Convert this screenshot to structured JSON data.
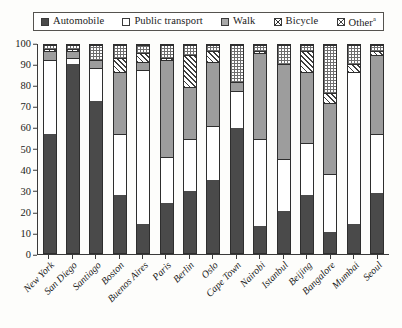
{
  "legend": {
    "items": [
      {
        "label": "Automobile",
        "icon": "solid-dark-square-swatch",
        "key": "auto",
        "color": "#4a4a4a"
      },
      {
        "label": "Public transport",
        "icon": "empty-square-swatch",
        "key": "pt",
        "color": "#ffffff"
      },
      {
        "label": "Walk",
        "icon": "gray-square-swatch",
        "key": "walk",
        "color": "#9d9d9d"
      },
      {
        "label": "Bicycle",
        "icon": "crosshatch-square-swatch",
        "key": "bike",
        "color": "#3d3d3d"
      },
      {
        "label": "Other",
        "icon": "dotted-square-swatch",
        "key": "other",
        "color": "#6e6e6e",
        "superscript": "a"
      }
    ]
  },
  "y_axis": {
    "ticks": [
      "0",
      "10",
      "20",
      "30",
      "40",
      "50",
      "60",
      "70",
      "80",
      "90",
      "100"
    ]
  },
  "chart_data": {
    "type": "bar",
    "stacked": true,
    "title": "",
    "xlabel": "",
    "ylabel": "",
    "ylim": [
      0,
      100
    ],
    "grid": false,
    "legend_position": "top",
    "categories": [
      "New York",
      "San Diego",
      "Santiago",
      "Boston",
      "Buenos Aires",
      "Paris",
      "Berlin",
      "Oslo",
      "Cape Town",
      "Nairobi",
      "Istanbul",
      "Beijing",
      "Bangalore",
      "Mumbai",
      "Seoul"
    ],
    "series": [
      {
        "name": "Automobile",
        "values": [
          57,
          91,
          73,
          28,
          14,
          24,
          30,
          35,
          60,
          13,
          20,
          28,
          10,
          14,
          29
        ]
      },
      {
        "name": "Public transport",
        "values": [
          36,
          3,
          16,
          29,
          74,
          22,
          25,
          26,
          18,
          42,
          25,
          25,
          28,
          73,
          28
        ]
      },
      {
        "name": "Walk",
        "values": [
          4,
          3,
          4,
          30,
          4,
          47,
          25,
          31,
          4,
          41,
          46,
          34,
          34,
          0,
          38
        ]
      },
      {
        "name": "Bicycle",
        "values": [
          1,
          1,
          0,
          7,
          4,
          1,
          15,
          5,
          0,
          1,
          0,
          10,
          5,
          4,
          2
        ]
      },
      {
        "name": "Other",
        "values": [
          2,
          2,
          7,
          6,
          4,
          6,
          5,
          3,
          18,
          3,
          9,
          3,
          23,
          9,
          3
        ]
      }
    ]
  }
}
